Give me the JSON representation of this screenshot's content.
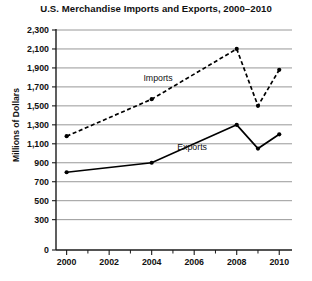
{
  "chart_data": {
    "type": "line",
    "title": "U.S. Merchandise Imports and Exports, 2000–2010",
    "xlabel": "",
    "ylabel": "Millions of Dollars",
    "grid": true,
    "legend_position": "inline",
    "x": [
      2000,
      2004,
      2008,
      2009,
      2010
    ],
    "xlim": [
      1999.5,
      2010.6
    ],
    "ylim": [
      0,
      2300
    ],
    "yticks": [
      0,
      300,
      500,
      700,
      900,
      1100,
      1300,
      1500,
      1700,
      1900,
      2100,
      2300
    ],
    "ytick_labels": [
      "0",
      "300",
      "500",
      "700",
      "900",
      "1,100",
      "1,300",
      "1,500",
      "1,700",
      "1,900",
      "2,100",
      "2,300"
    ],
    "xticks": [
      2000,
      2002,
      2004,
      2006,
      2008,
      2010
    ],
    "xtick_labels": [
      "2000",
      "2002",
      "2004",
      "2006",
      "2008",
      "2010"
    ],
    "xminor_ticks": [
      2001,
      2003,
      2005,
      2007,
      2009
    ],
    "series": [
      {
        "name": "Imports",
        "style": "dashed",
        "color": "#000000",
        "x": [
          2000,
          2004,
          2008,
          2009,
          2010
        ],
        "values": [
          1180,
          1570,
          2100,
          1500,
          1880
        ]
      },
      {
        "name": "Exports",
        "style": "solid",
        "color": "#000000",
        "x": [
          2000,
          2004,
          2008,
          2009,
          2010
        ],
        "values": [
          800,
          900,
          1300,
          1050,
          1200
        ]
      }
    ],
    "annotations": [
      {
        "text": "Imports",
        "x": 2004.3,
        "y": 1760
      },
      {
        "text": "Exports",
        "x": 2005.9,
        "y": 1030
      }
    ]
  }
}
